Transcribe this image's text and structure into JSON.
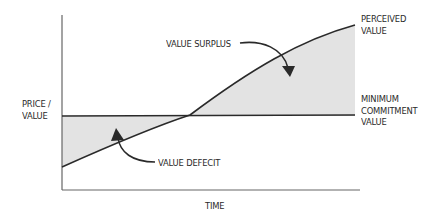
{
  "diagram": {
    "axis_y_label_line1": "PRICE /",
    "axis_y_label_line2": "VALUE",
    "axis_x_label": "TIME",
    "series": {
      "perceived_value_line1": "PERCEIVED",
      "perceived_value_line2": "VALUE",
      "minimum_commitment_line1": "MINIMUM",
      "minimum_commitment_line2": "COMMITMENT",
      "minimum_commitment_line3": "VALUE"
    },
    "annotations": {
      "surplus": "VALUE SURPLUS",
      "deficit": "VALUE DEFECIT"
    },
    "colors": {
      "line": "#2a2a2a",
      "axis": "#555555",
      "fill": "#e3e3e3",
      "text": "#2a2a2a"
    }
  }
}
